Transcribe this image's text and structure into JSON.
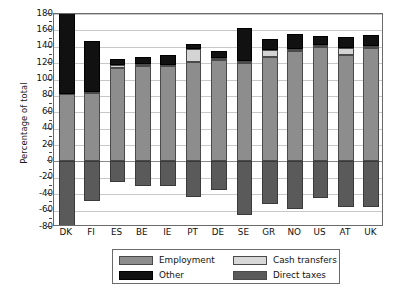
{
  "chart_data": {
    "type": "bar",
    "title": "",
    "subtitle": "",
    "xlabel": "",
    "ylabel": "Percentage of total",
    "ylim": [
      -80,
      180
    ],
    "ytick_step": 20,
    "grid": true,
    "stacked": true,
    "legend_position": "bottom",
    "yticks": [
      180,
      160,
      140,
      120,
      100,
      80,
      60,
      40,
      20,
      0,
      -20,
      -40,
      -60,
      -80
    ],
    "ytick_labels": [
      "180",
      "160",
      "140",
      "120",
      "100",
      "80",
      "60",
      "40",
      "20",
      "0",
      "-20",
      "-40",
      "-60",
      "-80"
    ],
    "categories": [
      "DK",
      "FI",
      "ES",
      "BE",
      "IE",
      "PT",
      "DE",
      "SE",
      "GR",
      "NO",
      "US",
      "AT",
      "UK"
    ],
    "series": [
      {
        "name": "Employment",
        "color": "#8d8d8d",
        "values": [
          82,
          83,
          114,
          116,
          116,
          122,
          124,
          120,
          128,
          135,
          140,
          130,
          139
        ]
      },
      {
        "name": "Cash transfers",
        "color": "#d4d4d4",
        "values": [
          0,
          2,
          4,
          3,
          2,
          15,
          2,
          3,
          8,
          2,
          2,
          8,
          2
        ]
      },
      {
        "name": "Other",
        "color": "#111111",
        "values": [
          100,
          62,
          7,
          8,
          12,
          6,
          9,
          40,
          13,
          19,
          11,
          14,
          13
        ]
      },
      {
        "name": "Direct taxes",
        "color": "#5a5a5a",
        "values": [
          -82,
          -48,
          -25,
          -30,
          -30,
          -44,
          -35,
          -65,
          -52,
          -58,
          -45,
          -56,
          -55
        ]
      }
    ],
    "totals": [
      182,
      147,
      125,
      127,
      130,
      143,
      135,
      163,
      149,
      156,
      153,
      152,
      154
    ]
  },
  "legend": {
    "items": [
      {
        "label": "Employment",
        "swatch": "employment"
      },
      {
        "label": "Cash transfers",
        "swatch": "cash"
      },
      {
        "label": "Other",
        "swatch": "other"
      },
      {
        "label": "Direct taxes",
        "swatch": "taxes"
      }
    ]
  },
  "colors": {
    "employment": "#8d8d8d",
    "cash_transfers": "#d4d4d4",
    "other": "#111111",
    "direct_taxes": "#5a5a5a",
    "grid": "#c8c8c8",
    "axis": "#6a6a6a",
    "background": "#ffffff"
  }
}
